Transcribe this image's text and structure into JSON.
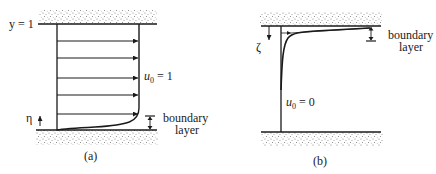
{
  "figure": {
    "panel_a": {
      "caption": "(a)",
      "top_label": "y = 1",
      "velocity_label_main": "u",
      "velocity_label_sub": "0",
      "velocity_label_rest": " = 1",
      "axis_label": "η",
      "boundary_label_line1": "boundary",
      "boundary_label_line2": "layer",
      "arrow_count": 5
    },
    "panel_b": {
      "caption": "(b)",
      "velocity_label_main": "u",
      "velocity_label_sub": "0",
      "velocity_label_rest": " = 0",
      "axis_label": "ζ",
      "boundary_label_line1": "boundary",
      "boundary_label_line2": "layer"
    },
    "colors": {
      "line": "#1a1a1a",
      "wall_stipple": "#8a8a8a",
      "background": "#ffffff"
    }
  }
}
